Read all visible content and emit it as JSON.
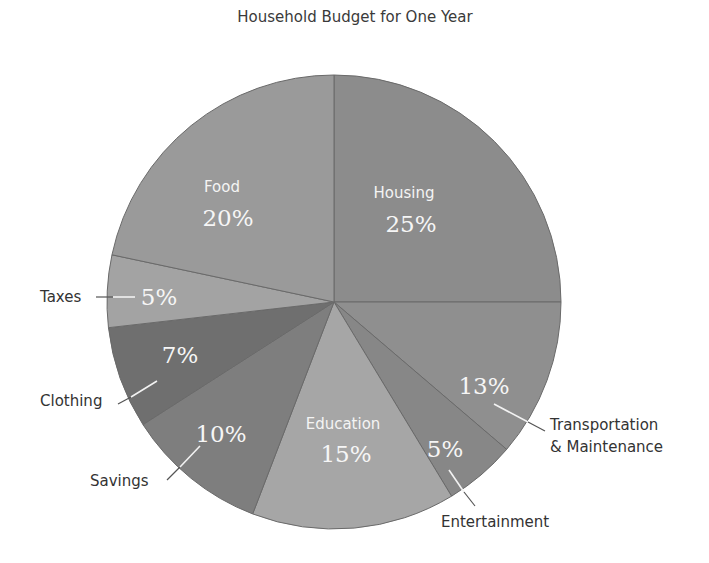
{
  "chart_data": {
    "type": "pie",
    "title": "Household Budget for One Year",
    "categories": [
      "Housing",
      "Transportation & Maintenance",
      "Entertainment",
      "Education",
      "Savings",
      "Clothing",
      "Taxes",
      "Food"
    ],
    "values": [
      25,
      13,
      5,
      15,
      10,
      7,
      5,
      20
    ],
    "unit": "%",
    "legend": "none (direct labels)"
  },
  "pie": {
    "cx": 334,
    "cy": 302,
    "r": 227,
    "slices": [
      {
        "name": "Housing",
        "label": "Housing",
        "pct": "25%",
        "start": 0,
        "end": 90,
        "color": "#8c8c8c"
      },
      {
        "name": "Transportation & Maintenance",
        "label_line1": "Transportation",
        "label_line2": "& Maintenance",
        "pct": "13%",
        "start": 90,
        "end": 130.5,
        "color": "#8f8f8f"
      },
      {
        "name": "Entertainment",
        "label": "Entertainment",
        "pct": "5%",
        "start": 130.5,
        "end": 148.8,
        "color": "#878787"
      },
      {
        "name": "Education",
        "label": "Education",
        "pct": "15%",
        "start": 148.8,
        "end": 201,
        "color": "#a6a6a6"
      },
      {
        "name": "Savings",
        "label": "Savings",
        "pct": "10%",
        "start": 201,
        "end": 237.3,
        "color": "#7e7e7e"
      },
      {
        "name": "Clothing",
        "label": "Clothing",
        "pct": "7%",
        "start": 237.3,
        "end": 263.5,
        "color": "#6f6f6f"
      },
      {
        "name": "Taxes",
        "label": "Taxes",
        "pct": "5%",
        "start": 263.5,
        "end": 282,
        "color": "#a3a3a3"
      },
      {
        "name": "Food",
        "label": "Food",
        "pct": "20%",
        "start": 282,
        "end": 360,
        "color": "#9a9a9a"
      }
    ]
  }
}
